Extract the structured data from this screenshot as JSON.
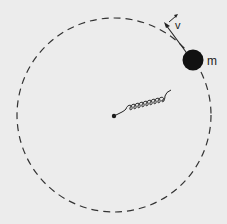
{
  "diagram": {
    "mass_label": "m",
    "velocity_label": "v",
    "colors": {
      "background": "#ececec",
      "ink": "#1a1a1a"
    }
  }
}
